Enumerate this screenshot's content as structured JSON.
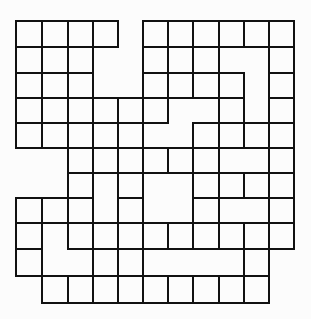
{
  "diagram": {
    "type": "grid-puzzle-outline",
    "colors": {
      "background": "#fcfcfc",
      "line": "#111111"
    },
    "column_lines_x": [
      16,
      42,
      68,
      93,
      118,
      143,
      168,
      193,
      219,
      244,
      269,
      294
    ],
    "row_lines_y": [
      21,
      47,
      73,
      98,
      123,
      148,
      173,
      198,
      223,
      249,
      276,
      303
    ],
    "horizontal_segments": [
      {
        "row": 0,
        "spans": [
          [
            0,
            4
          ],
          [
            5,
            11
          ]
        ]
      },
      {
        "row": 1,
        "spans": [
          [
            0,
            4
          ],
          [
            5,
            11
          ]
        ]
      },
      {
        "row": 2,
        "spans": [
          [
            0,
            3
          ],
          [
            5,
            9
          ],
          [
            10,
            11
          ]
        ]
      },
      {
        "row": 3,
        "spans": [
          [
            0,
            9
          ],
          [
            10,
            11
          ]
        ]
      },
      {
        "row": 4,
        "spans": [
          [
            0,
            6
          ],
          [
            7,
            11
          ]
        ]
      },
      {
        "row": 5,
        "spans": [
          [
            0,
            11
          ]
        ]
      },
      {
        "row": 6,
        "spans": [
          [
            2,
            11
          ]
        ]
      },
      {
        "row": 7,
        "spans": [
          [
            0,
            3
          ],
          [
            4,
            5
          ],
          [
            7,
            11
          ]
        ]
      },
      {
        "row": 8,
        "spans": [
          [
            0,
            11
          ]
        ]
      },
      {
        "row": 9,
        "spans": [
          [
            0,
            1
          ],
          [
            2,
            11
          ]
        ]
      },
      {
        "row": 10,
        "spans": [
          [
            0,
            10
          ]
        ]
      },
      {
        "row": 11,
        "spans": [
          [
            1,
            10
          ]
        ]
      }
    ],
    "vertical_segments": [
      {
        "cell_row": 0,
        "columns": [
          0,
          1,
          2,
          3,
          4,
          5,
          6,
          7,
          8,
          9,
          10,
          11
        ]
      },
      {
        "cell_row": 1,
        "columns": [
          0,
          1,
          2,
          3,
          5,
          6,
          7,
          8,
          10,
          11
        ]
      },
      {
        "cell_row": 2,
        "columns": [
          0,
          1,
          2,
          3,
          5,
          6,
          7,
          8,
          9,
          10,
          11
        ]
      },
      {
        "cell_row": 3,
        "columns": [
          0,
          1,
          2,
          3,
          4,
          5,
          6,
          8,
          9,
          10,
          11
        ]
      },
      {
        "cell_row": 4,
        "columns": [
          0,
          1,
          2,
          3,
          4,
          5,
          7,
          8,
          9,
          10,
          11
        ]
      },
      {
        "cell_row": 5,
        "columns": [
          2,
          3,
          4,
          5,
          6,
          7,
          8,
          10,
          11
        ]
      },
      {
        "cell_row": 6,
        "columns": [
          2,
          3,
          4,
          5,
          7,
          8,
          9,
          10,
          11
        ]
      },
      {
        "cell_row": 7,
        "columns": [
          0,
          1,
          2,
          3,
          4,
          5,
          7,
          8,
          10,
          11
        ]
      },
      {
        "cell_row": 8,
        "columns": [
          0,
          1,
          2,
          3,
          4,
          5,
          6,
          7,
          8,
          9,
          10,
          11
        ]
      },
      {
        "cell_row": 9,
        "columns": [
          0,
          1,
          3,
          4,
          5,
          9,
          10
        ]
      },
      {
        "cell_row": 10,
        "columns": [
          1,
          2,
          3,
          4,
          5,
          6,
          7,
          8,
          9,
          10
        ]
      }
    ]
  }
}
